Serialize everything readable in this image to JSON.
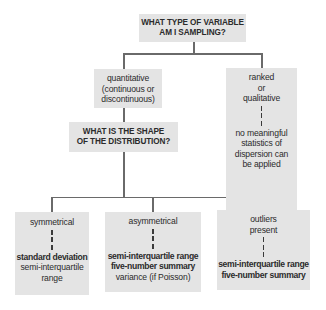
{
  "diagram": {
    "type": "decision-tree",
    "root": {
      "label_lines": [
        "WHAT TYPE OF VARIABLE",
        "AM I SAMPLING?"
      ]
    },
    "quantitative": {
      "label_lines": [
        "quantitative",
        "(continuous or",
        "discontinuous)"
      ]
    },
    "ranked": {
      "label_lines": [
        "ranked",
        "or",
        "qualitative"
      ],
      "result_lines": [
        "no meaningful",
        "statistics of",
        "dispersion can",
        "be applied"
      ]
    },
    "shape_question": {
      "label_lines": [
        "WHAT IS THE SHAPE",
        "OF THE DISTRIBUTION?"
      ]
    },
    "symmetrical": {
      "label_lines": [
        "symmetrical"
      ],
      "bold_results": [
        "standard deviation"
      ],
      "plain_results": [
        "semi-interquartile",
        "range"
      ]
    },
    "asymmetrical": {
      "label_lines": [
        "asymmetrical"
      ],
      "bold_results": [
        "semi-interquartile range",
        "five-number summary"
      ],
      "plain_results": [
        "variance (if Poisson)"
      ]
    },
    "outliers": {
      "label_lines": [
        "outliers",
        "present"
      ],
      "bold_results": [
        "semi-interquartile range",
        "five-number summary"
      ]
    },
    "colors": {
      "box_fill": "#e4e4e4",
      "connector": "#6a6a6a",
      "text": "#2b2b2b"
    }
  }
}
